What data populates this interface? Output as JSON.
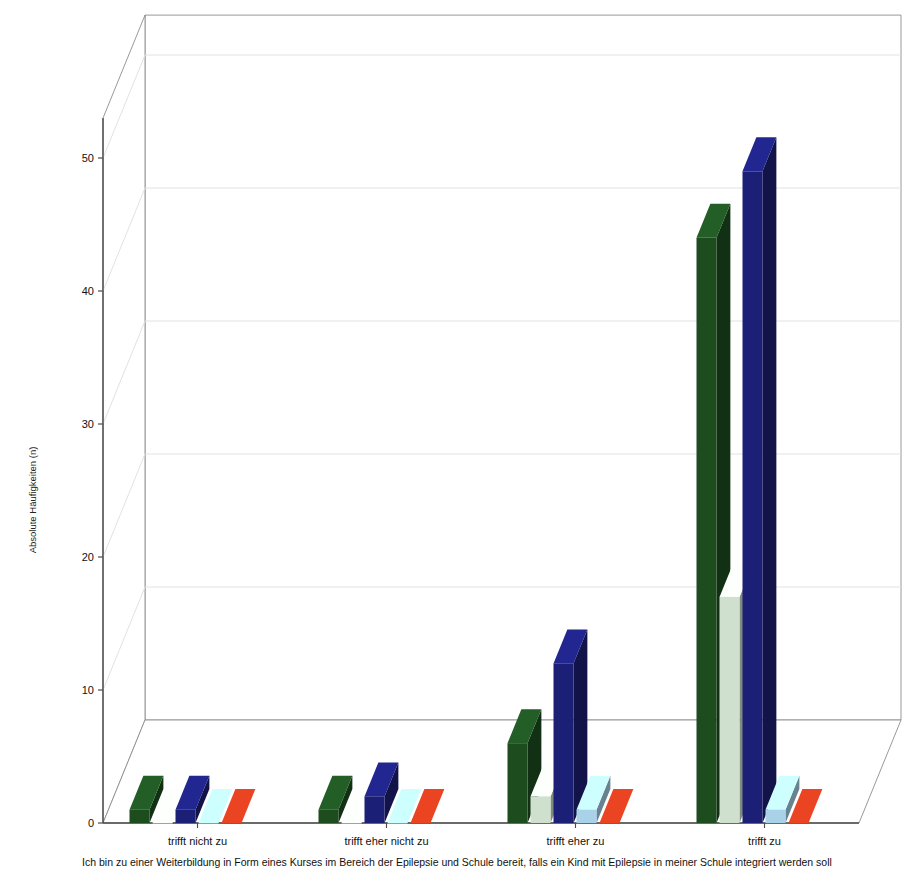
{
  "legend": {
    "left_items": [
      {
        "label": "Das wäre in jeder Hinsicht spannend.",
        "color": "#1d4d1f",
        "outlined": false
      },
      {
        "label": "Nicht ganz einfach - aber warum nicht?",
        "color": "#1c1f76",
        "outlined": false
      },
      {
        "label": "Nein, nur das nicht!",
        "color": "#8e2116",
        "outlined": false
      }
    ],
    "right_items": [
      {
        "label": "Keine Ahnung, was das für mich bedeuten würde.",
        "color": "#cfe0cf",
        "outlined": true
      },
      {
        "label": "Ich denke, ich wäre überfordert",
        "color": "#a9d1e8",
        "outlined": true
      }
    ]
  },
  "axis": {
    "ylabel": "Absolute Häufigkeiten (n)",
    "yticks": [
      "0",
      "10",
      "20",
      "30",
      "40",
      "50"
    ],
    "ymin": 0,
    "ymax": 53
  },
  "caption": "Ich bin zu einer Weiterbildung in Form eines Kurses im Bereich der Epilepsie und Schule bereit, falls ein Kind mit Epilepsie in meiner Schule integriert werden soll",
  "chart_data": {
    "type": "bar",
    "title": "",
    "xlabel": "Ich bin zu einer Weiterbildung in Form eines Kurses im Bereich der Epilepsie und Schule bereit, falls ein Kind mit Epilepsie in meiner Schule integriert werden soll",
    "ylabel": "Absolute Häufigkeiten (n)",
    "ylim": [
      0,
      53
    ],
    "yticks": [
      0,
      10,
      20,
      30,
      40,
      50
    ],
    "grid": true,
    "legend_position": "top",
    "style": "3d-grouped-bars",
    "categories": [
      "trifft nicht zu",
      "trifft eher nicht zu",
      "trifft eher zu",
      "trifft zu"
    ],
    "series": [
      {
        "name": "Das wäre in jeder Hinsicht spannend.",
        "color": "#1d4d1f",
        "values": [
          1,
          1,
          6,
          44
        ]
      },
      {
        "name": "Keine Ahnung, was das für mich bedeuten würde.",
        "color": "#cfe0cf",
        "values": [
          0,
          0,
          2,
          17
        ]
      },
      {
        "name": "Nicht ganz einfach - aber warum nicht?",
        "color": "#1c1f76",
        "values": [
          1,
          2,
          12,
          49
        ]
      },
      {
        "name": "Ich denke, ich wäre überfordert",
        "color": "#a9d1e8",
        "values": [
          0,
          0,
          1,
          1
        ]
      },
      {
        "name": "Nein, nur das nicht!",
        "color": "#c0381c",
        "values": [
          0,
          0,
          0,
          0
        ]
      }
    ]
  },
  "colors": {
    "dark_green": "#1d4d1f",
    "pale_green": "#cfe0cf",
    "navy": "#1c1f76",
    "light_blue": "#a9d1e8",
    "red": "#c0381c",
    "floor": "#ffffff",
    "gridline": "#e2e2e2",
    "axis": "#4a4a4a"
  }
}
